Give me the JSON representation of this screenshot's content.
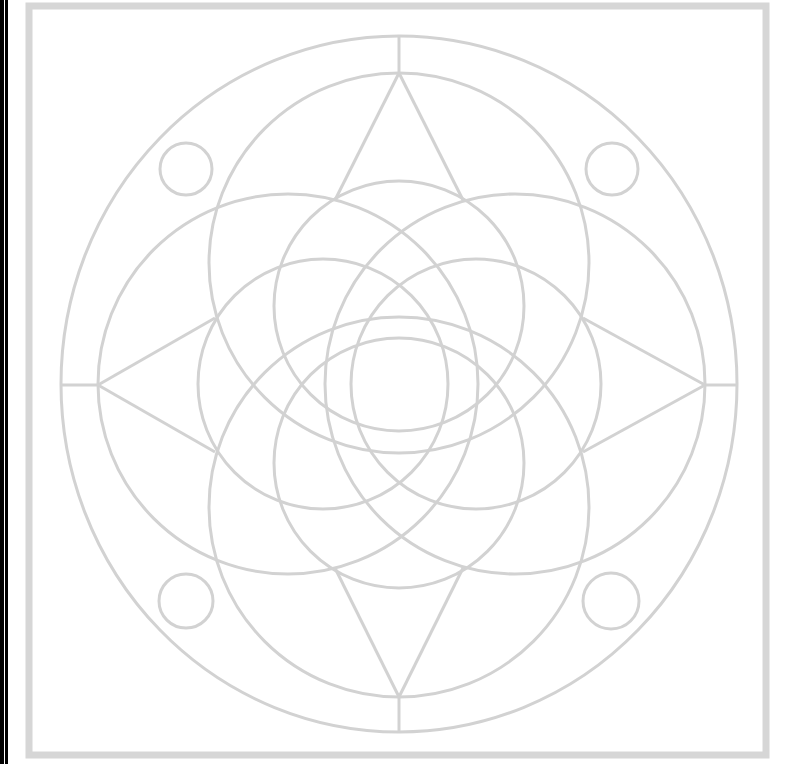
{
  "figure": {
    "line_color": "#d2d2d2",
    "frame_color": "#d6d6d6",
    "edge_bar_color": "#000000",
    "frame": {
      "x": 29,
      "y": 5,
      "width": 737,
      "height": 751
    },
    "center": [
      399,
      384
    ],
    "outer_ellipse": {
      "rx": 338,
      "ry": 348
    },
    "large_circles": [
      {
        "name": "top",
        "cx": 399,
        "cy": 263,
        "r": 190
      },
      {
        "name": "bottom",
        "cx": 399,
        "cy": 507,
        "r": 190
      },
      {
        "name": "left",
        "cx": 288,
        "cy": 384,
        "r": 190
      },
      {
        "name": "right",
        "cx": 515,
        "cy": 384,
        "r": 190
      }
    ],
    "medium_circles": [
      {
        "name": "top",
        "cx": 399,
        "cy": 306,
        "r": 125
      },
      {
        "name": "bottom",
        "cx": 399,
        "cy": 463,
        "r": 125
      },
      {
        "name": "left",
        "cx": 323,
        "cy": 384,
        "r": 125
      },
      {
        "name": "right",
        "cx": 476,
        "cy": 384,
        "r": 125
      }
    ],
    "small_circles": [
      {
        "name": "top-left",
        "cx": 186,
        "cy": 169,
        "r": 26
      },
      {
        "name": "top-right",
        "cx": 612,
        "cy": 169,
        "r": 26
      },
      {
        "name": "bottom-left",
        "cx": 186,
        "cy": 601,
        "r": 27
      },
      {
        "name": "bottom-right",
        "cx": 611,
        "cy": 601,
        "r": 28
      }
    ],
    "star_vertices": {
      "top": [
        399,
        73
      ],
      "bottom": [
        399,
        697
      ],
      "left": [
        98,
        385
      ],
      "right": [
        705,
        385
      ]
    },
    "axis_ticks": [
      {
        "name": "top",
        "x1": 399,
        "y1": 36,
        "x2": 399,
        "y2": 73
      },
      {
        "name": "bottom",
        "x1": 399,
        "y1": 697,
        "x2": 399,
        "y2": 733
      },
      {
        "name": "left",
        "x1": 62,
        "y1": 385,
        "x2": 98,
        "y2": 385
      },
      {
        "name": "right",
        "x1": 705,
        "y1": 385,
        "x2": 737,
        "y2": 385
      }
    ]
  }
}
